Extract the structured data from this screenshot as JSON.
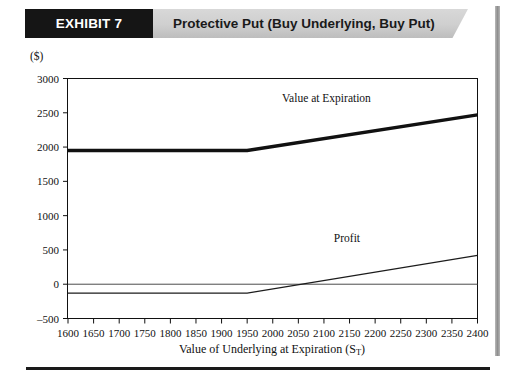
{
  "banner": {
    "exhibit_number": "EXHIBIT 7",
    "title": "Protective Put (Buy Underlying, Buy Put)",
    "black_block_color": "#151515",
    "gray_block_color": "#cfcfcf"
  },
  "chart_data": {
    "type": "line",
    "title": "Protective Put (Buy Underlying, Buy Put)",
    "xlabel": "Value of Underlying at Expiration (S",
    "xlabel_subscript": "T",
    "xlabel_suffix": ")",
    "ylabel": "($)",
    "xlim": [
      1600,
      2400
    ],
    "ylim": [
      -500,
      3000
    ],
    "xticks": [
      1600,
      1650,
      1700,
      1750,
      1800,
      1850,
      1900,
      1950,
      2000,
      2050,
      2100,
      2150,
      2200,
      2250,
      2300,
      2350,
      2400
    ],
    "yticks": [
      -500,
      0,
      500,
      1000,
      1500,
      2000,
      2500,
      3000
    ],
    "grid": false,
    "legend": "annotations",
    "zero_line": 0,
    "strike": 1950,
    "breakeven": 2080,
    "series": [
      {
        "name": "Value at Expiration",
        "label_x": 2105,
        "label_y": 2660,
        "stroke": "#111111",
        "width": 3.4,
        "x": [
          1600,
          1950,
          2400
        ],
        "values": [
          1950,
          1950,
          2470
        ]
      },
      {
        "name": "Profit",
        "label_x": 2145,
        "label_y": 620,
        "stroke": "#1c1c1c",
        "width": 1.1,
        "x": [
          1600,
          1950,
          2400
        ],
        "values": [
          -130,
          -130,
          420
        ]
      }
    ]
  }
}
